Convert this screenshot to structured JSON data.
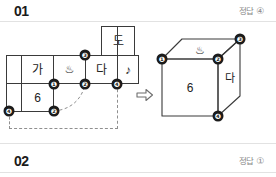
{
  "problems": [
    {
      "number": "01",
      "answer_label": "정답",
      "answer_value": "④"
    },
    {
      "number": "02",
      "answer_label": "정답",
      "answer_value": "①"
    }
  ],
  "figure": {
    "net": {
      "cells": [
        {
          "id": "cell-ga",
          "text": "가"
        },
        {
          "id": "cell-onsen",
          "text": "♨"
        },
        {
          "id": "cell-da",
          "text": "다"
        },
        {
          "id": "cell-note",
          "text": "♪"
        },
        {
          "id": "cell-do",
          "text": "도"
        },
        {
          "id": "cell-six",
          "text": "6"
        }
      ],
      "vertices": [
        {
          "id": "net-vertex-1",
          "text": "❶"
        },
        {
          "id": "net-vertex-3",
          "text": "❸"
        },
        {
          "id": "net-vertex-2-top",
          "text": "❷"
        },
        {
          "id": "net-vertex-4-top",
          "text": "❹"
        },
        {
          "id": "net-vertex-4-bottom",
          "text": "❹"
        },
        {
          "id": "net-vertex-2-bottom",
          "text": "❷"
        }
      ]
    },
    "arrow": {
      "direction": "right"
    },
    "cube": {
      "front_face_text": "6",
      "top_face_text": "♨",
      "right_face_text": "다",
      "vertices": [
        {
          "id": "cube-vertex-1",
          "text": "❶"
        },
        {
          "id": "cube-vertex-2",
          "text": "❷"
        },
        {
          "id": "cube-vertex-3",
          "text": "❸"
        },
        {
          "id": "cube-vertex-4",
          "text": "❹"
        }
      ]
    }
  },
  "colors": {
    "ink": "#1b1b1b",
    "line": "#3a3a3a",
    "muted": "#8a8a8a",
    "dash": "#8f8f8f",
    "rule": "#e2e2e2"
  }
}
